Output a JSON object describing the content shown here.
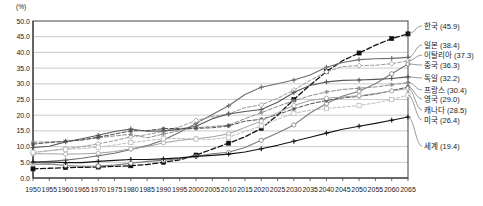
{
  "chart_data": {
    "type": "line",
    "title": "",
    "subtitle": "",
    "unit_label": "(%)",
    "xlabel": "",
    "ylabel": "",
    "ylim": [
      0.0,
      50.0
    ],
    "ytick_step": 5.0,
    "ytick_labels": [
      "0.0",
      "5.0",
      "10.0",
      "15.0",
      "20.0",
      "25.0",
      "30.0",
      "35.0",
      "40.0",
      "45.0",
      "50.0"
    ],
    "grid": true,
    "legend_position": "right-outside",
    "x": [
      1950,
      1955,
      1960,
      1965,
      1970,
      1975,
      1980,
      1985,
      1990,
      1995,
      2000,
      2005,
      2010,
      2015,
      2020,
      2025,
      2030,
      2035,
      2040,
      2045,
      2050,
      2055,
      2060,
      2065
    ],
    "xtick_labels": [
      "1950",
      "1955",
      "1960",
      "1965",
      "1970",
      "1975",
      "1980",
      "1985",
      "1990",
      "1995",
      "2000",
      "2005",
      "2010",
      "2015",
      "2020",
      "2025",
      "2030",
      "2035",
      "2040",
      "2045",
      "2050",
      "2055",
      "2060",
      "2065"
    ],
    "series": [
      {
        "name": "한국",
        "label": "한국 (45.9)",
        "end_value": 45.9,
        "color": "#111111",
        "dash": "5,2.5",
        "marker": "square-filled",
        "width": 1.3,
        "values": [
          2.9,
          3.1,
          3.3,
          3.4,
          3.5,
          3.7,
          3.9,
          4.3,
          5.0,
          5.8,
          7.3,
          9.2,
          11.1,
          13.1,
          15.8,
          20.0,
          25.0,
          29.6,
          33.9,
          37.4,
          39.8,
          42.3,
          44.4,
          45.9
        ]
      },
      {
        "name": "일본",
        "label": "일본 (38.4)",
        "end_value": 38.4,
        "color": "#6e6e6e",
        "dash": "",
        "marker": "plus",
        "width": 1.1,
        "values": [
          4.9,
          5.3,
          5.7,
          6.3,
          7.1,
          7.9,
          9.1,
          10.3,
          12.1,
          14.6,
          17.4,
          20.2,
          23.0,
          26.6,
          28.9,
          30.0,
          31.2,
          32.8,
          35.3,
          36.8,
          37.7,
          38.0,
          38.1,
          38.4
        ]
      },
      {
        "name": "이탈리아",
        "label": "이탈리아 (37.3)",
        "end_value": 37.3,
        "color": "#9a9a9a",
        "dash": "3.5,2",
        "marker": "diamond-open",
        "width": 1.0,
        "values": [
          8.1,
          8.7,
          9.3,
          10.0,
          10.9,
          11.9,
          13.1,
          13.8,
          14.9,
          16.3,
          18.3,
          19.6,
          20.4,
          22.4,
          23.3,
          25.4,
          28.0,
          31.1,
          33.8,
          35.5,
          35.8,
          35.9,
          36.4,
          37.3
        ]
      },
      {
        "name": "중국",
        "label": "중국 (36.3)",
        "end_value": 36.3,
        "color": "#7b7b7b",
        "dash": "",
        "marker": "circle-open",
        "width": 1.1,
        "values": [
          4.4,
          4.5,
          4.0,
          3.7,
          3.8,
          4.1,
          4.7,
          5.3,
          5.6,
          6.2,
          6.9,
          7.7,
          8.2,
          9.7,
          12.0,
          14.3,
          16.9,
          20.7,
          23.7,
          26.1,
          27.6,
          30.0,
          33.2,
          36.3
        ]
      },
      {
        "name": "독일",
        "label": "독일 (32.2)",
        "end_value": 32.2,
        "color": "#585858",
        "dash": "",
        "marker": "plus",
        "width": 1.1,
        "values": [
          9.7,
          10.1,
          11.5,
          12.5,
          13.6,
          14.8,
          15.6,
          14.9,
          15.0,
          15.5,
          16.5,
          18.9,
          20.4,
          21.2,
          21.8,
          24.1,
          27.2,
          29.5,
          30.6,
          31.1,
          31.2,
          31.4,
          31.7,
          32.2
        ]
      },
      {
        "name": "프랑스",
        "label": "프랑스 (30.4)",
        "end_value": 30.4,
        "color": "#8d8d8d",
        "dash": "4,2",
        "marker": "star",
        "width": 1.0,
        "values": [
          11.4,
          11.5,
          11.6,
          12.1,
          12.8,
          13.4,
          13.9,
          12.8,
          14.0,
          15.1,
          16.0,
          16.4,
          16.8,
          18.9,
          20.8,
          22.8,
          24.6,
          26.2,
          27.4,
          28.2,
          28.6,
          29.0,
          29.7,
          30.4
        ]
      },
      {
        "name": "영국",
        "label": "영국 (29.0)",
        "end_value": 29.0,
        "color": "#4f4f4f",
        "dash": "4,2",
        "marker": "star",
        "width": 1.0,
        "values": [
          10.8,
          11.3,
          11.7,
          12.1,
          13.0,
          14.0,
          15.0,
          15.1,
          15.7,
          15.8,
          15.8,
          16.0,
          16.6,
          18.1,
          18.7,
          20.2,
          22.0,
          23.6,
          24.7,
          25.5,
          26.0,
          26.7,
          27.8,
          29.0
        ]
      },
      {
        "name": "캐나다",
        "label": "캐나다 (28.5)",
        "end_value": 28.5,
        "color": "#a2a2a2",
        "dash": "",
        "marker": "circle-open",
        "width": 1.0,
        "values": [
          7.7,
          7.7,
          7.6,
          7.7,
          7.9,
          8.4,
          9.3,
          10.0,
          11.2,
          12.0,
          12.5,
          13.1,
          14.1,
          16.1,
          18.1,
          20.8,
          23.1,
          24.7,
          25.4,
          25.8,
          26.2,
          26.9,
          27.7,
          28.5
        ]
      },
      {
        "name": "미국",
        "label": "미국 (26.4)",
        "end_value": 26.4,
        "color": "#bdbdbd",
        "dash": "3,2",
        "marker": "square-open",
        "width": 1.0,
        "values": [
          8.2,
          8.7,
          9.1,
          9.4,
          9.8,
          10.5,
          11.3,
          11.9,
          12.5,
          12.6,
          12.4,
          12.3,
          13.0,
          14.8,
          16.6,
          18.7,
          20.6,
          21.6,
          22.1,
          22.6,
          23.1,
          23.9,
          25.0,
          26.4
        ]
      },
      {
        "name": "세계",
        "label": "세계 (19.4)",
        "end_value": 19.4,
        "color": "#151515",
        "dash": "",
        "marker": "plus",
        "width": 1.1,
        "values": [
          5.1,
          5.1,
          4.9,
          4.9,
          5.3,
          5.6,
          5.9,
          5.9,
          6.1,
          6.4,
          6.9,
          7.2,
          7.6,
          8.3,
          9.3,
          10.4,
          11.7,
          13.0,
          14.3,
          15.5,
          16.5,
          17.4,
          18.4,
          19.4
        ]
      }
    ]
  }
}
